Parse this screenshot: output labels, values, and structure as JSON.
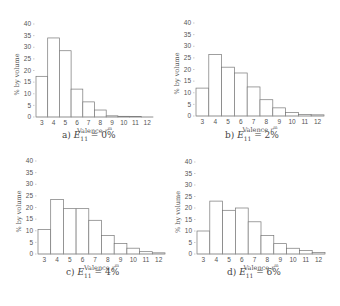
{
  "chart_data": [
    {
      "type": "bar",
      "id": "a",
      "caption_prefix": "a)",
      "caption_var": "E",
      "caption_sub": "11",
      "caption_value": "= 0%",
      "categories": [
        "3",
        "4",
        "5",
        "6",
        "7",
        "8",
        "9",
        "10",
        "11",
        "12"
      ],
      "values": [
        17.5,
        34,
        28.5,
        12,
        6.5,
        3,
        0.5,
        0.3,
        0.2,
        0
      ],
      "xlabel": "Valence r^m",
      "ylabel": "% by volume",
      "yticks": [
        0,
        5,
        10,
        15,
        20,
        25,
        30,
        35,
        40
      ],
      "ylim": [
        0,
        40
      ],
      "grid": false,
      "layout": {
        "x0": 36,
        "x1": 153,
        "y0": 117,
        "y40": 24,
        "caption_x": 62,
        "caption_y": 136
      }
    },
    {
      "type": "bar",
      "id": "b",
      "caption_prefix": "b)",
      "caption_var": "E",
      "caption_sub": "11",
      "caption_value": "= 2%",
      "categories": [
        "3",
        "4",
        "5",
        "6",
        "7",
        "8",
        "9",
        "10",
        "11",
        "12"
      ],
      "values": [
        12,
        26.5,
        21,
        18.5,
        12.5,
        7,
        3.5,
        1.5,
        0.7,
        0.5
      ],
      "xlabel": "Valence r^m",
      "ylabel": "% by volume",
      "yticks": [
        0,
        5,
        10,
        15,
        20,
        25,
        30,
        35,
        40
      ],
      "ylim": [
        0,
        40
      ],
      "grid": false,
      "layout": {
        "x0": 196,
        "x1": 324,
        "y0": 116,
        "y40": 23,
        "caption_x": 225,
        "caption_y": 136
      }
    },
    {
      "type": "bar",
      "id": "c",
      "caption_prefix": "c)",
      "caption_var": "E",
      "caption_sub": "11",
      "caption_value": "= 4%",
      "categories": [
        "3",
        "4",
        "5",
        "6",
        "7",
        "8",
        "9",
        "10",
        "11",
        "12"
      ],
      "values": [
        10.5,
        23.5,
        19.5,
        19.5,
        14.5,
        8,
        4.5,
        2.5,
        1,
        0.5
      ],
      "xlabel": "Valence r^m",
      "ylabel": "% by volume",
      "yticks": [
        0,
        5,
        10,
        15,
        20,
        25,
        30,
        35,
        40
      ],
      "ylim": [
        0,
        40
      ],
      "grid": false,
      "layout": {
        "x0": 38,
        "x1": 165,
        "y0": 254,
        "y40": 161,
        "caption_x": 66,
        "caption_y": 273
      }
    },
    {
      "type": "bar",
      "id": "d",
      "caption_prefix": "d)",
      "caption_var": "E",
      "caption_sub": "11",
      "caption_value": "= 6%",
      "categories": [
        "3",
        "4",
        "5",
        "6",
        "7",
        "8",
        "9",
        "10",
        "11",
        "12"
      ],
      "values": [
        10,
        23,
        19,
        20,
        14,
        8,
        4.5,
        2.5,
        1.5,
        0.7
      ],
      "xlabel": "Valence r^m",
      "ylabel": "% by volume",
      "yticks": [
        0,
        5,
        10,
        15,
        20,
        25,
        30,
        35,
        40
      ],
      "ylim": [
        0,
        40
      ],
      "grid": false,
      "layout": {
        "x0": 197,
        "x1": 325,
        "y0": 254,
        "y40": 162,
        "caption_x": 227,
        "caption_y": 273
      }
    }
  ],
  "labels": {
    "ylabel": "% by volume",
    "xlabel_text": "Valence ",
    "xlabel_var": "r",
    "xlabel_sup": "m"
  }
}
